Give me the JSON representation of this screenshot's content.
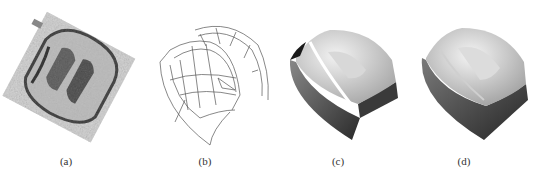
{
  "figure": {
    "panels": [
      {
        "id": "a",
        "label": "(a)",
        "description": "grayscale scanned point-cloud image of part"
      },
      {
        "id": "b",
        "label": "(b)",
        "description": "wireframe surface model"
      },
      {
        "id": "c",
        "label": "(c)",
        "description": "shaded surface model with gaps"
      },
      {
        "id": "d",
        "label": "(d)",
        "description": "shaded solid model"
      }
    ]
  }
}
